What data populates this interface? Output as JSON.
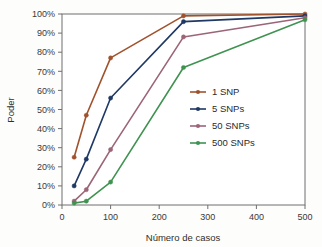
{
  "chart_data": {
    "type": "line",
    "title": "",
    "subtitle": "",
    "xlabel": "Número de casos",
    "ylabel": "Poder",
    "x": [
      25,
      50,
      100,
      250,
      500
    ],
    "xlim": [
      0,
      500
    ],
    "ylim": [
      0,
      100
    ],
    "xticks": [
      0,
      100,
      200,
      300,
      400,
      500
    ],
    "xtick_labels": [
      "0",
      "100",
      "200",
      "300",
      "400",
      "500"
    ],
    "yticks": [
      0,
      10,
      20,
      30,
      40,
      50,
      60,
      70,
      80,
      90,
      100
    ],
    "ytick_labels": [
      "0%",
      "10%",
      "20%",
      "30%",
      "40%",
      "50%",
      "60%",
      "70%",
      "80%",
      "90%",
      "100%"
    ],
    "grid": false,
    "legend_position": "center-right",
    "series": [
      {
        "name": "1 SNP",
        "color": "#a0522d",
        "values": [
          25,
          47,
          77,
          99,
          100
        ]
      },
      {
        "name": "5 SNPs",
        "color": "#1f3864",
        "values": [
          10,
          24,
          56,
          96,
          99
        ]
      },
      {
        "name": "50 SNPs",
        "color": "#9c6478",
        "values": [
          2,
          8,
          29,
          88,
          98
        ]
      },
      {
        "name": "500 SNPs",
        "color": "#3f9350",
        "values": [
          1,
          2,
          12,
          72,
          97
        ]
      }
    ]
  },
  "axes": {
    "x_title": "Número de casos",
    "y_title": "Poder"
  },
  "legend": {
    "entries": [
      {
        "label": "1 SNP"
      },
      {
        "label": "5 SNPs"
      },
      {
        "label": "50 SNPs"
      },
      {
        "label": "500 SNPs"
      }
    ]
  }
}
